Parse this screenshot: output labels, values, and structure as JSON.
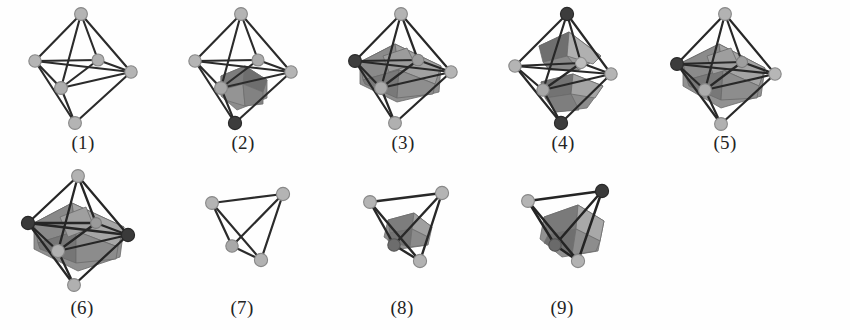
{
  "figure": {
    "background_color": "#fefefe",
    "rows": 2,
    "columns": 5,
    "total_items": 9,
    "palette": {
      "edge_dark": "#262626",
      "edge_mid": "#3a3a3a",
      "vertex_light": "#b6b6b6",
      "vertex_light_stroke": "#8a8a8a",
      "vertex_dark": "#3c3c3c",
      "vertex_dark_stroke": "#2a2a2a",
      "face_light": "#b9b9b9",
      "face_mid": "#9a9a9a",
      "face_dark": "#7d7d7d",
      "face_darker": "#6a6a6a",
      "label_color": "#232323"
    },
    "items": [
      {
        "id": 1,
        "label": "(1)",
        "shape": "octahedron",
        "inner_solid": "none",
        "dark_vertices": [],
        "description": "empty octahedron wireframe"
      },
      {
        "id": 2,
        "label": "(2)",
        "shape": "octahedron",
        "inner_solid": "small-lower",
        "dark_vertices": [
          "bottom"
        ],
        "description": "octahedron with small shaded polyhedron in lower half"
      },
      {
        "id": 3,
        "label": "(3)",
        "shape": "octahedron",
        "inner_solid": "large-equatorial",
        "dark_vertices": [
          "left"
        ],
        "description": "octahedron with large shaded polyhedron filling equator"
      },
      {
        "id": 4,
        "label": "(4)",
        "shape": "octahedron",
        "inner_solid": "two-caps",
        "dark_vertices": [
          "top",
          "bottom"
        ],
        "description": "octahedron with two shaded caps, upper and lower"
      },
      {
        "id": 5,
        "label": "(5)",
        "shape": "octahedron",
        "inner_solid": "large-equatorial",
        "dark_vertices": [
          "left"
        ],
        "description": "octahedron with large shaded equatorial polyhedron"
      },
      {
        "id": 6,
        "label": "(6)",
        "shape": "octahedron",
        "inner_solid": "large-equatorial",
        "dark_vertices": [
          "left",
          "right"
        ],
        "description": "octahedron with large shaded polyhedron, two dark vertices"
      },
      {
        "id": 7,
        "label": "(7)",
        "shape": "tetrahedron",
        "inner_solid": "none",
        "dark_vertices": [],
        "description": "empty tetrahedron wireframe"
      },
      {
        "id": 8,
        "label": "(8)",
        "shape": "tetrahedron",
        "inner_solid": "small-centre",
        "dark_vertices": [
          "inner"
        ],
        "description": "tetrahedron with small shaded polyhedron inside"
      },
      {
        "id": 9,
        "label": "(9)",
        "shape": "tetrahedron",
        "inner_solid": "large-centre",
        "dark_vertices": [
          "right",
          "inner"
        ],
        "description": "tetrahedron with larger shaded polyhedron inside"
      }
    ]
  }
}
